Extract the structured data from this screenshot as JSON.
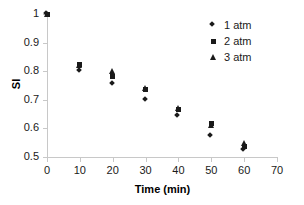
{
  "chart_data": {
    "type": "scatter",
    "title": "",
    "xlabel": "Time (min)",
    "ylabel": "SI",
    "xlim": [
      0,
      70
    ],
    "ylim": [
      0.5,
      1.0
    ],
    "xticks": [
      "0",
      "10",
      "20",
      "30",
      "40",
      "50",
      "60",
      "70"
    ],
    "yticks": [
      "0.5",
      "0.6",
      "0.7",
      "0.8",
      "0.9",
      "1"
    ],
    "xtick_values": [
      0,
      10,
      20,
      30,
      40,
      50,
      60,
      70
    ],
    "ytick_values": [
      0.5,
      0.6,
      0.7,
      0.8,
      0.9,
      1.0
    ],
    "grid": false,
    "legend_position": "top-right",
    "x": [
      0,
      10,
      20,
      30,
      40,
      50,
      60
    ],
    "series": [
      {
        "name": "1 atm",
        "marker": "diamond",
        "color": "#1a1a1a",
        "values": [
          1.0,
          0.8,
          0.755,
          0.7,
          0.645,
          0.575,
          0.525
        ]
      },
      {
        "name": "2 atm",
        "marker": "square",
        "color": "#1a1a1a",
        "values": [
          1.0,
          0.825,
          0.78,
          0.735,
          0.665,
          0.617,
          0.535
        ]
      },
      {
        "name": "3 atm",
        "marker": "triangle",
        "color": "#1a1a1a",
        "values": [
          1.0,
          0.82,
          0.8,
          0.74,
          0.67,
          0.612,
          0.55
        ]
      }
    ]
  },
  "legend": {
    "items": [
      {
        "label": "1 atm",
        "marker": "diamond"
      },
      {
        "label": "2 atm",
        "marker": "square"
      },
      {
        "label": "3 atm",
        "marker": "triangle"
      }
    ]
  },
  "axes": {
    "x_title": "Time (min)",
    "y_title": "SI"
  }
}
